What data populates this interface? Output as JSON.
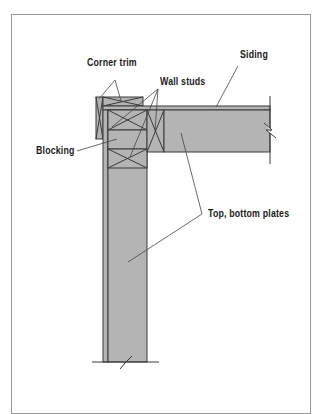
{
  "diagram": {
    "type": "framing-section",
    "colors": {
      "lumber_fill": "#b4b4b4",
      "outline": "#3a3a3a",
      "leader": "#444444",
      "frame_border": "#9a9a9a",
      "label_text": "#1a1a1a"
    },
    "labels": [
      {
        "id": "corner-trim",
        "text": "Corner trim"
      },
      {
        "id": "wall-studs",
        "text": "Wall studs"
      },
      {
        "id": "siding",
        "text": "Siding"
      },
      {
        "id": "blocking",
        "text": "Blocking"
      },
      {
        "id": "top-bottom-plates",
        "text": "Top, bottom plates"
      }
    ]
  }
}
